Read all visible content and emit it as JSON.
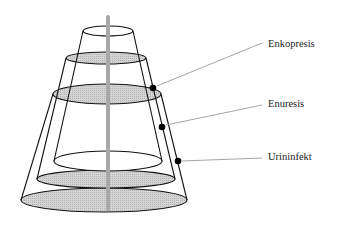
{
  "diagram": {
    "type": "nested-cones",
    "colors": {
      "outline": "#111111",
      "shade": "#c8c8c8",
      "axis": "#a8a8a8",
      "leader": "#9a9a9a",
      "dot": "#000000"
    },
    "labels": [
      {
        "text": "Enkopresis"
      },
      {
        "text": "Enuresis"
      },
      {
        "text": "Urininfekt"
      }
    ]
  }
}
